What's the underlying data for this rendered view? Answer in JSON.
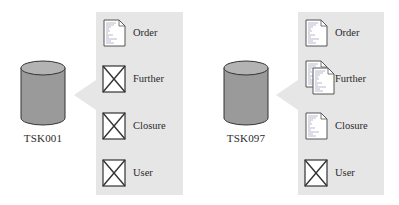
{
  "diagram": {
    "groups": [
      {
        "database_label": "TSK001",
        "items": [
          {
            "label": "Order",
            "icon": "document-icon"
          },
          {
            "label": "Further",
            "icon": "missing-image-icon"
          },
          {
            "label": "Closure",
            "icon": "missing-image-icon"
          },
          {
            "label": "User",
            "icon": "missing-image-icon"
          }
        ]
      },
      {
        "database_label": "TSK097",
        "items": [
          {
            "label": "Order",
            "icon": "document-icon"
          },
          {
            "label": "Further",
            "icon": "multiple-documents-icon"
          },
          {
            "label": "Closure",
            "icon": "document-icon"
          },
          {
            "label": "User",
            "icon": "missing-image-icon"
          }
        ]
      }
    ],
    "colors": {
      "panel": "#e6e6e6",
      "cylinder_body": "#9a9a9a",
      "cylinder_top": "#b3b3b3",
      "stroke": "#333333"
    }
  }
}
